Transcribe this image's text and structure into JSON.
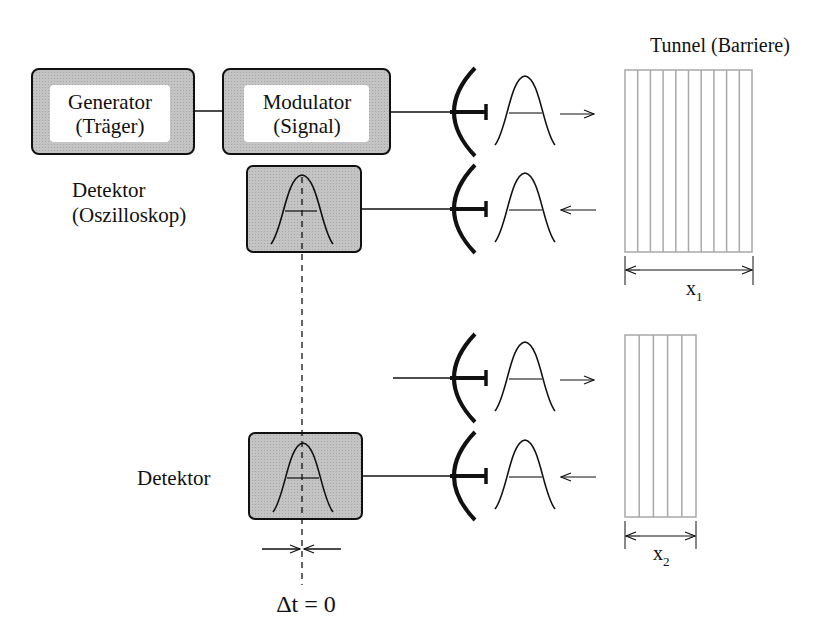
{
  "title": "Tunnel (Barriere)",
  "blocks": {
    "generator": {
      "line1": "Generator",
      "line2": "(Träger)"
    },
    "modulator": {
      "line1": "Modulator",
      "line2": "(Signal)"
    },
    "detector_top": {
      "line1": "Detektor",
      "line2": "(Oszilloskop)"
    },
    "detector_bottom": {
      "line1": "Detektor"
    }
  },
  "barriers": [
    {
      "label": "x",
      "subscript": "1",
      "columns": 10
    },
    {
      "label": "x",
      "subscript": "2",
      "columns": 5
    }
  ],
  "delta_label": "Δt = 0",
  "colors": {
    "box_fill": "#bdbdbd",
    "stroke": "#111111",
    "barrier_stroke": "#a8a8a8"
  }
}
